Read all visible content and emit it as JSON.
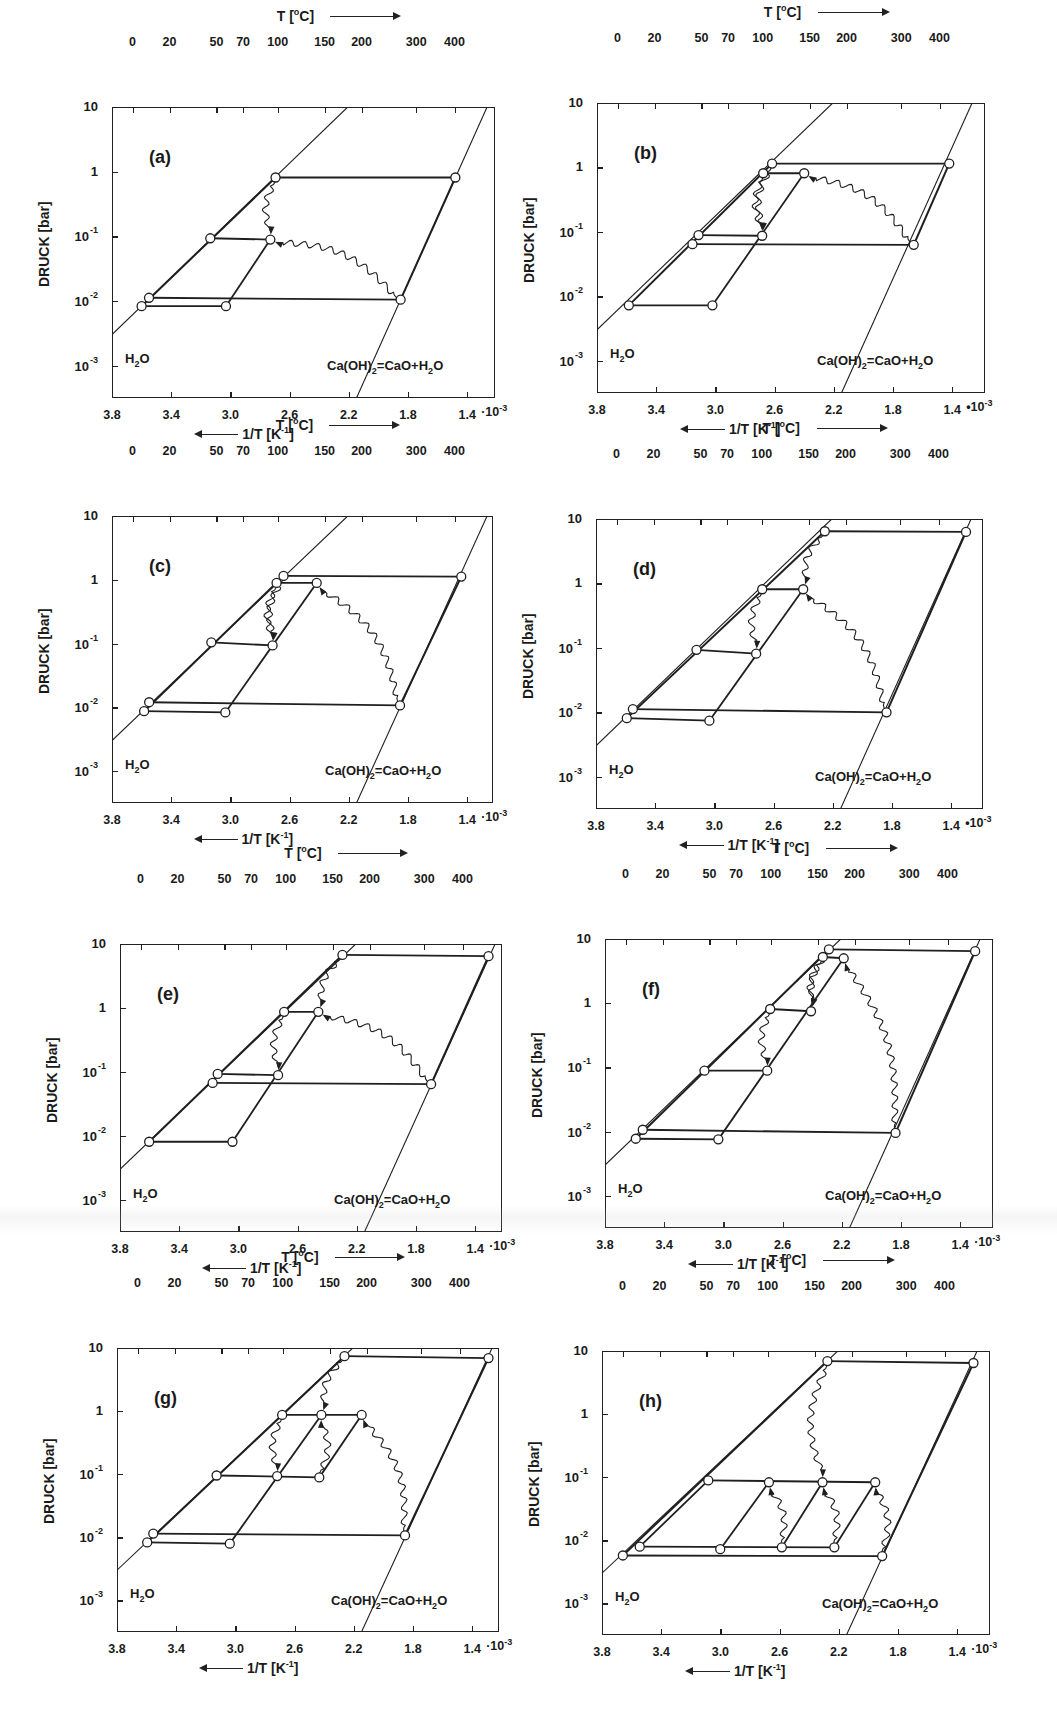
{
  "chart_data": {
    "type": "line",
    "xlabel": "1/T [K^-1]",
    "x_top_label": "T [°C]",
    "ylabel": "DRUCK [bar]",
    "x_scale": "1/T ×10^-3 (reversed, 3.8 → 1.4)",
    "y_scale": "log10 pressure",
    "xticks_bottom": [
      "3.8",
      "3.4",
      "3.0",
      "2.6",
      "2.2",
      "1.8",
      "1.4"
    ],
    "xticks_bottom_values": [
      3.8,
      3.4,
      3.0,
      2.6,
      2.2,
      1.8,
      1.4
    ],
    "xticks_top": [
      "0",
      "20",
      "50",
      "70",
      "100",
      "150",
      "200",
      "300",
      "400"
    ],
    "xticks_top_values_C": [
      0,
      20,
      50,
      70,
      100,
      150,
      200,
      300,
      400
    ],
    "yticks": [
      "10",
      "1",
      "10^-1",
      "10^-2",
      "10^-3"
    ],
    "yticks_log": [
      1,
      0,
      -1,
      -2,
      -3
    ],
    "ylim_log": [
      -3.5,
      1
    ],
    "boundary_lines": [
      {
        "name": "H2O",
        "label": "H2O",
        "equation": "log10P = -2.52 + 2.21*(3.8 - x)"
      },
      {
        "name": "Ca(OH)2 = CaO + H2O",
        "label": "Ca(OH)2=CaO+H2O",
        "equation": "log10P = -1.98 + 5.1*(1.85 - x)"
      }
    ],
    "panels": [
      {
        "id": "a",
        "points": [
          [
            2.695,
            -0.09
          ],
          [
            1.48,
            -0.09
          ],
          [
            3.136,
            -1.03
          ],
          [
            2.73,
            -1.05
          ],
          [
            3.55,
            -1.95
          ],
          [
            3.6,
            -2.08
          ],
          [
            3.03,
            -2.08
          ],
          [
            1.85,
            -1.98
          ]
        ],
        "segments": [
          [
            0,
            1
          ],
          [
            2,
            3
          ],
          [
            4,
            7
          ],
          [
            5,
            6
          ],
          [
            6,
            3
          ]
        ],
        "waves": [
          [
            0,
            3
          ],
          [
            7,
            3
          ]
        ]
      },
      {
        "id": "b",
        "points": [
          [
            2.617,
            0.06
          ],
          [
            1.42,
            0.06
          ],
          [
            2.677,
            -0.09
          ],
          [
            2.4,
            -0.09
          ],
          [
            3.114,
            -1.05
          ],
          [
            3.155,
            -1.19
          ],
          [
            2.684,
            -1.06
          ],
          [
            1.66,
            -1.2
          ],
          [
            3.585,
            -2.14
          ],
          [
            3.02,
            -2.14
          ]
        ],
        "segments": [
          [
            0,
            1
          ],
          [
            2,
            3
          ],
          [
            4,
            6
          ],
          [
            5,
            7
          ],
          [
            8,
            9
          ],
          [
            9,
            3
          ]
        ],
        "waves": [
          [
            2,
            6
          ],
          [
            0,
            6
          ],
          [
            7,
            3
          ]
        ]
      },
      {
        "id": "c",
        "points": [
          [
            2.641,
            0.06
          ],
          [
            1.44,
            0.05
          ],
          [
            2.688,
            -0.05
          ],
          [
            2.417,
            -0.05
          ],
          [
            3.129,
            -0.98
          ],
          [
            2.715,
            -1.03
          ],
          [
            3.549,
            -1.92
          ],
          [
            3.583,
            -2.06
          ],
          [
            3.034,
            -2.08
          ],
          [
            1.854,
            -1.97
          ]
        ],
        "segments": [
          [
            0,
            1
          ],
          [
            2,
            3
          ],
          [
            4,
            5
          ],
          [
            6,
            9
          ],
          [
            7,
            8
          ],
          [
            8,
            3
          ]
        ],
        "waves": [
          [
            2,
            5
          ],
          [
            0,
            5
          ],
          [
            9,
            3
          ]
        ]
      },
      {
        "id": "d",
        "points": [
          [
            2.254,
            0.81
          ],
          [
            1.3,
            0.8
          ],
          [
            2.677,
            -0.09
          ],
          [
            2.4,
            -0.09
          ],
          [
            3.121,
            -1.03
          ],
          [
            2.718,
            -1.09
          ],
          [
            3.551,
            -1.95
          ],
          [
            3.592,
            -2.09
          ],
          [
            3.034,
            -2.13
          ],
          [
            1.837,
            -2.0
          ]
        ],
        "segments": [
          [
            0,
            1
          ],
          [
            2,
            3
          ],
          [
            4,
            5
          ],
          [
            6,
            9
          ],
          [
            7,
            8
          ],
          [
            8,
            3
          ]
        ],
        "waves": [
          [
            0,
            3
          ],
          [
            2,
            5
          ],
          [
            9,
            3
          ]
        ]
      },
      {
        "id": "e",
        "points": [
          [
            2.297,
            0.83
          ],
          [
            1.31,
            0.81
          ],
          [
            2.691,
            -0.06
          ],
          [
            2.46,
            -0.06
          ],
          [
            3.14,
            -1.03
          ],
          [
            3.174,
            -1.17
          ],
          [
            2.732,
            -1.05
          ],
          [
            1.698,
            -1.19
          ],
          [
            3.603,
            -2.09
          ],
          [
            3.04,
            -2.09
          ]
        ],
        "segments": [
          [
            0,
            1
          ],
          [
            2,
            3
          ],
          [
            4,
            6
          ],
          [
            5,
            7
          ],
          [
            8,
            9
          ],
          [
            9,
            3
          ]
        ],
        "waves": [
          [
            0,
            3
          ],
          [
            2,
            6
          ],
          [
            7,
            3
          ]
        ]
      },
      {
        "id": "f",
        "points": [
          [
            2.287,
            0.84
          ],
          [
            1.299,
            0.81
          ],
          [
            2.328,
            0.72
          ],
          [
            2.187,
            0.7
          ],
          [
            2.684,
            -0.09
          ],
          [
            2.408,
            -0.125
          ],
          [
            3.128,
            -1.05
          ],
          [
            2.704,
            -1.05
          ],
          [
            3.545,
            -1.97
          ],
          [
            3.592,
            -2.11
          ],
          [
            3.034,
            -2.12
          ],
          [
            1.837,
            -2.02
          ]
        ],
        "segments": [
          [
            0,
            1
          ],
          [
            2,
            3
          ],
          [
            4,
            5
          ],
          [
            6,
            7
          ],
          [
            8,
            11
          ],
          [
            9,
            10
          ],
          [
            10,
            3
          ]
        ],
        "waves": [
          [
            2,
            5
          ],
          [
            0,
            5
          ],
          [
            4,
            7
          ],
          [
            11,
            3
          ]
        ]
      },
      {
        "id": "g",
        "points": [
          [
            2.263,
            0.87
          ],
          [
            1.29,
            0.84
          ],
          [
            2.684,
            -0.06
          ],
          [
            2.419,
            -0.06
          ],
          [
            2.147,
            -0.06
          ],
          [
            3.127,
            -1.02
          ],
          [
            2.718,
            -1.03
          ],
          [
            2.433,
            -1.05
          ],
          [
            3.555,
            -1.94
          ],
          [
            3.596,
            -2.08
          ],
          [
            3.038,
            -2.1
          ],
          [
            1.854,
            -1.97
          ]
        ],
        "segments": [
          [
            0,
            1
          ],
          [
            2,
            4
          ],
          [
            5,
            7
          ],
          [
            8,
            11
          ],
          [
            9,
            10
          ],
          [
            10,
            3
          ],
          [
            7,
            4
          ]
        ],
        "waves": [
          [
            0,
            3
          ],
          [
            2,
            6
          ],
          [
            7,
            3
          ],
          [
            11,
            4
          ]
        ]
      },
      {
        "id": "h",
        "points": [
          [
            2.277,
            0.84
          ],
          [
            1.29,
            0.81
          ],
          [
            3.082,
            -1.05
          ],
          [
            2.672,
            -1.08
          ],
          [
            2.31,
            -1.08
          ],
          [
            1.954,
            -1.08
          ],
          [
            3.545,
            -2.1
          ],
          [
            3.001,
            -2.14
          ],
          [
            2.585,
            -2.11
          ],
          [
            2.23,
            -2.11
          ],
          [
            3.659,
            -2.24
          ],
          [
            1.907,
            -2.25
          ]
        ],
        "segments": [
          [
            0,
            1
          ],
          [
            2,
            5
          ],
          [
            6,
            9
          ],
          [
            10,
            11
          ],
          [
            6,
            2
          ],
          [
            7,
            3
          ],
          [
            8,
            4
          ],
          [
            9,
            5
          ]
        ],
        "waves": [
          [
            0,
            4
          ],
          [
            8,
            3
          ],
          [
            9,
            4
          ],
          [
            11,
            5
          ]
        ]
      }
    ]
  },
  "labels": {
    "temp_axis": "T [°C]",
    "temp_axis_alt": "T [°C]",
    "invT_axis": "1/T [K",
    "invT_exp": "-1",
    "invT_close": "]",
    "pressure_axis": "DRUCK [bar]",
    "h2o": "H",
    "h2o_sub": "2",
    "h2o_tail": "O",
    "reaction_a": "Ca(OH)",
    "reaction_sub": "2",
    "reaction_b": "=CaO+H",
    "reaction_sub2": "2",
    "reaction_c": "O",
    "x_multiplier_plain": "·10",
    "x_multiplier_dot": "•10",
    "x_exp": "-3",
    "y_ticks": [
      {
        "base": "10",
        "exp": ""
      },
      {
        "base": "1",
        "exp": ""
      },
      {
        "base": "10",
        "exp": "-1"
      },
      {
        "base": "10",
        "exp": "-2"
      },
      {
        "base": "10",
        "exp": "-3"
      }
    ],
    "bottom_ticks": [
      "3.8",
      "3.4",
      "3.0",
      "2.6",
      "2.2",
      "1.8",
      "1.4"
    ],
    "top_ticks": [
      "0",
      "20",
      "50",
      "70",
      "100",
      "150",
      "200",
      "300",
      "400"
    ]
  },
  "panels": [
    {
      "tag": "(a)",
      "frame": [
        112,
        107,
        495,
        398
      ],
      "mult": "·10"
    },
    {
      "tag": "(b)",
      "frame": [
        597,
        103,
        985,
        393
      ],
      "mult": "•10"
    },
    {
      "tag": "(c)",
      "frame": [
        112,
        516,
        493,
        803
      ],
      "mult": "·10"
    },
    {
      "tag": "(d)",
      "frame": [
        596,
        519,
        983,
        809
      ],
      "mult": "•10"
    },
    {
      "tag": "(e)",
      "frame": [
        120,
        944,
        502,
        1232
      ],
      "mult": "·10"
    },
    {
      "tag": "(f)",
      "frame": [
        605,
        939,
        993,
        1228
      ],
      "mult": "·10"
    },
    {
      "tag": "(g)",
      "frame": [
        117,
        1348,
        499,
        1632
      ],
      "mult": "·10"
    },
    {
      "tag": "(h)",
      "frame": [
        602,
        1351,
        990,
        1635
      ],
      "mult": "·10"
    }
  ],
  "colors": {
    "ink": "#1f1f1f",
    "background": "#ffffff",
    "marker_fill": "#ffffff"
  }
}
